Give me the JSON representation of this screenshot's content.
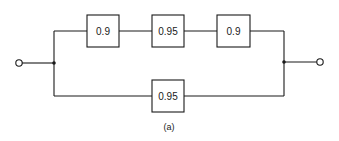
{
  "diagram": {
    "type": "reliability-block-diagram",
    "caption": "(a)",
    "top_branch": {
      "blocks": [
        {
          "label": "0.9"
        },
        {
          "label": "0.95"
        },
        {
          "label": "0.9"
        }
      ]
    },
    "bottom_branch": {
      "blocks": [
        {
          "label": "0.95"
        }
      ]
    },
    "colors": {
      "line": "#1a1a1a",
      "background": "#ffffff"
    }
  }
}
